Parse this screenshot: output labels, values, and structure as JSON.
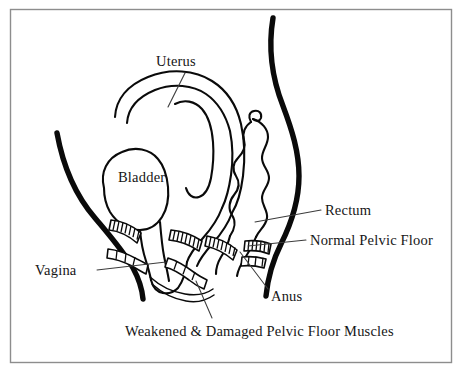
{
  "diagram": {
    "view": "sagittal cross-section",
    "style": "black-and-white line drawing",
    "background_color": "#ffffff",
    "ink_color": "#0a0a0a",
    "frame_color": "#8d8d8d"
  },
  "labels": {
    "uterus": "Uterus",
    "bladder": "Bladder",
    "vagina": "Vagina",
    "rectum": "Rectum",
    "normal_pelvic_floor": "Normal Pelvic Floor",
    "anus": "Anus",
    "weakened_muscles": "Weakened & Damaged Pelvic Floor Muscles"
  },
  "structures": [
    {
      "name": "uterus",
      "label": "Uterus",
      "description": "hooked double-outlined organ at upper center"
    },
    {
      "name": "bladder",
      "label": "Bladder",
      "description": "rounded organ at center left"
    },
    {
      "name": "vagina",
      "label": "Vagina",
      "description": "canal descending at left of center"
    },
    {
      "name": "rectum",
      "label": "Rectum",
      "description": "wavy-walled tube at right of center"
    },
    {
      "name": "normal-pelvic-floor",
      "label": "Normal Pelvic Floor",
      "description": "hatched muscle bands"
    },
    {
      "name": "anus",
      "label": "Anus",
      "description": "opening at lower right of rectum"
    },
    {
      "name": "weakened-pelvic-floor",
      "label": "Weakened & Damaged Pelvic Floor Muscles",
      "description": "sagging unhatched lower muscle bands"
    }
  ]
}
